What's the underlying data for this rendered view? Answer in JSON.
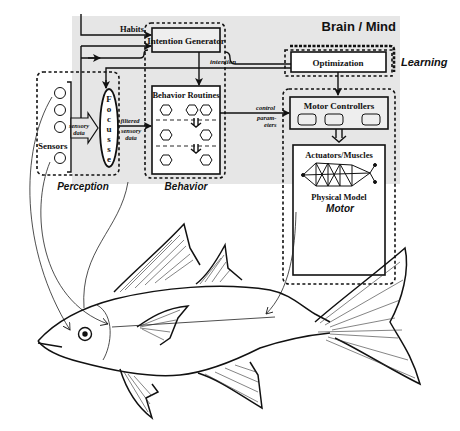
{
  "diagram": {
    "title": "Brain / Mind",
    "modules": {
      "perception": {
        "label": "Perception",
        "sensors_label": "Sensors",
        "focusser_label": "Focusser",
        "focusser_letters": [
          "F",
          "o",
          "c",
          "u",
          "s",
          "s",
          "e",
          "r"
        ],
        "sensory_data_label": [
          "sensory",
          "data"
        ]
      },
      "behavior": {
        "label": "Behavior",
        "intention_generator": "Intention Generator",
        "behavior_routines": "Behavior Routines",
        "habits_label": "Habits",
        "intention_label": "intention",
        "filtered_sensory_data_label": [
          "filtered",
          "sensory",
          "data"
        ]
      },
      "learning": {
        "label": "Learning",
        "optimization": "Optimization"
      },
      "motor": {
        "label": "Motor",
        "motor_controllers": "Motor Controllers",
        "control_parameters_label": [
          "control",
          "param-",
          "eters"
        ],
        "actuators": "Actuators/Muscles",
        "physical_model": "Physical Model"
      }
    },
    "colors": {
      "brain_background": "#e6e6e6",
      "stroke": "#111111"
    }
  }
}
